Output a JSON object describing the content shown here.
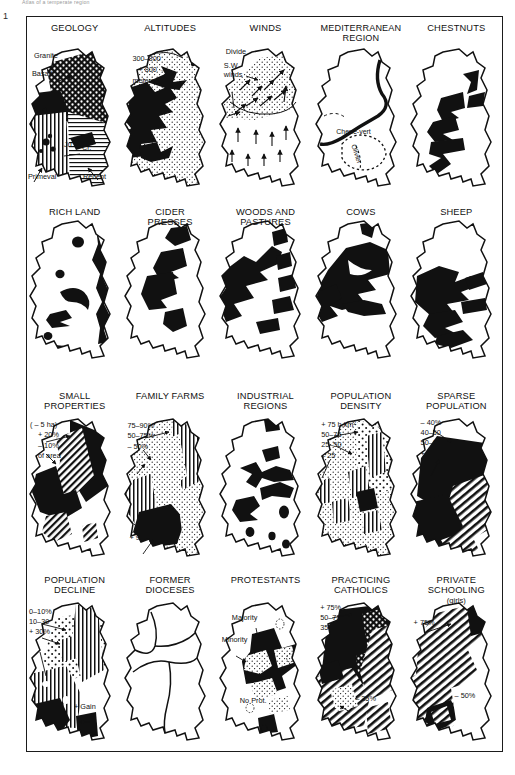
{
  "figure": {
    "number": "1",
    "running_head": "Atlas of a temperate region"
  },
  "panels": [
    {
      "id": "geology",
      "title": "GEOLOGY",
      "labels": {
        "granite": "Granite",
        "basalt": "Basalt",
        "ju": "Ju.",
        "cr": "Cr.",
        "primeval": "Primeval",
        "recent": "Recent"
      }
    },
    {
      "id": "altitudes",
      "title": "ALTITUDES",
      "labels": {
        "band_mid": "300–800",
        "band_high": "+ 800 →",
        "unit": "meters"
      }
    },
    {
      "id": "winds",
      "title": "WINDS",
      "labels": {
        "divide": "Divide",
        "sw_line1": "S.W.",
        "sw_line2": "winds"
      }
    },
    {
      "id": "mediterranean",
      "title": "MEDITERRANEAN REGION",
      "title_line1": "MEDITERRANEAN",
      "title_line2": "REGION",
      "labels": {
        "chene": "Chene-vert",
        "olivier": "Olivier"
      }
    },
    {
      "id": "chestnuts",
      "title": "CHESTNUTS",
      "labels": {}
    },
    {
      "id": "rich-land",
      "title": "RICH LAND",
      "labels": {}
    },
    {
      "id": "cider-presses",
      "title": "CIDER PRESSES",
      "title_line1": "CIDER",
      "title_line2": "PRESSES",
      "labels": {}
    },
    {
      "id": "woods-pastures",
      "title": "WOODS AND PASTURES",
      "title_line1": "WOODS AND",
      "title_line2": "PASTURES",
      "labels": {}
    },
    {
      "id": "cows",
      "title": "COWS",
      "labels": {}
    },
    {
      "id": "sheep",
      "title": "SHEEP",
      "labels": {}
    },
    {
      "id": "small-properties",
      "title": "SMALL PROPERTIES",
      "title_line1": "SMALL",
      "title_line2": "PROPERTIES",
      "labels": {
        "size": "( – 5 ha)",
        "class1": "+ 20%",
        "class2": "– 10%",
        "of_area": "of area"
      }
    },
    {
      "id": "family-farms",
      "title": "FAMILY FARMS",
      "labels": {
        "class1": "75–90%",
        "class2": "50–75%",
        "class3": "– 50%",
        "class4": "+ 90%"
      }
    },
    {
      "id": "industrial-regions",
      "title": "INDUSTRIAL REGIONS",
      "title_line1": "INDUSTRIAL",
      "title_line2": "REGIONS",
      "labels": {}
    },
    {
      "id": "population-density",
      "title": "POPULATION DENSITY",
      "title_line1": "POPULATION",
      "title_line2": "DENSITY",
      "labels": {
        "class1": "+ 75 h.km²",
        "class2": "50–75",
        "class3": "25–50",
        "class4": "– 25"
      }
    },
    {
      "id": "sparse-population",
      "title": "SPARSE POPULATION",
      "title_line1": "SPARSE",
      "title_line2": "POPULATION",
      "labels": {
        "class1": "– 40%",
        "class2": "40–50",
        "class3": "50–60",
        "class4": "+ 60%"
      }
    },
    {
      "id": "population-decline",
      "title": "POPULATION DECLINE",
      "title_line1": "POPULATION",
      "title_line2": "DECLINE",
      "labels": {
        "class1": "0–10%",
        "class2": "10–30",
        "class3": "+ 30%",
        "gain": "+ Gain"
      }
    },
    {
      "id": "former-dioceses",
      "title": "FORMER DIOCESES",
      "title_line1": "FORMER",
      "title_line2": "DIOCESES",
      "labels": {}
    },
    {
      "id": "protestants",
      "title": "PROTESTANTS",
      "labels": {
        "majority": "Majority",
        "minority": "Minority",
        "none": "No Prot."
      }
    },
    {
      "id": "practicing-catholics",
      "title": "PRACTICING CATHOLICS",
      "title_line1": "PRACTICING",
      "title_line2": "CATHOLICS",
      "labels": {
        "class1": "+ 75%",
        "class2": "50–75",
        "class3": "35–50",
        "class4": "– 35%"
      }
    },
    {
      "id": "private-schooling",
      "title": "PRIVATE SCHOOLING",
      "title_line1": "PRIVATE",
      "title_line2": "SCHOOLING",
      "subtitle": "(girls)",
      "labels": {
        "class1": "+ 75%",
        "class2": "– 50%"
      }
    }
  ]
}
